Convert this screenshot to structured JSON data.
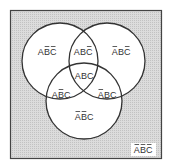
{
  "diagram": {
    "type": "venn",
    "sets": [
      "A",
      "B",
      "C"
    ],
    "colors": {
      "background": "#d4d4d4",
      "circle_fill": "#ffffff",
      "stroke": "#333333"
    },
    "regions": [
      {
        "id": "a-only",
        "letters": [
          {
            "c": "A",
            "bar": false
          },
          {
            "c": "B",
            "bar": true
          },
          {
            "c": "C",
            "bar": true
          }
        ]
      },
      {
        "id": "ab",
        "letters": [
          {
            "c": "A",
            "bar": false
          },
          {
            "c": "B",
            "bar": false
          },
          {
            "c": "C",
            "bar": true
          }
        ]
      },
      {
        "id": "b-only",
        "letters": [
          {
            "c": "A",
            "bar": true
          },
          {
            "c": "B",
            "bar": false
          },
          {
            "c": "C",
            "bar": true
          }
        ]
      },
      {
        "id": "abc",
        "letters": [
          {
            "c": "A",
            "bar": false
          },
          {
            "c": "B",
            "bar": false
          },
          {
            "c": "C",
            "bar": false
          }
        ]
      },
      {
        "id": "ac",
        "letters": [
          {
            "c": "A",
            "bar": false
          },
          {
            "c": "B",
            "bar": true
          },
          {
            "c": "C",
            "bar": false
          }
        ]
      },
      {
        "id": "bc",
        "letters": [
          {
            "c": "A",
            "bar": true
          },
          {
            "c": "B",
            "bar": false
          },
          {
            "c": "C",
            "bar": false
          }
        ]
      },
      {
        "id": "c-only",
        "letters": [
          {
            "c": "A",
            "bar": true
          },
          {
            "c": "B",
            "bar": true
          },
          {
            "c": "C",
            "bar": false
          }
        ]
      },
      {
        "id": "none",
        "letters": [
          {
            "c": "A",
            "bar": true
          },
          {
            "c": "B",
            "bar": true
          },
          {
            "c": "C",
            "bar": true
          }
        ]
      }
    ]
  }
}
